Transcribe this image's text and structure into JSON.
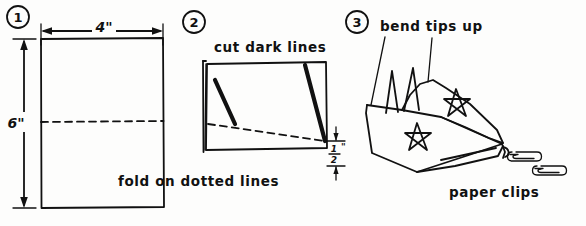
{
  "figure": {
    "ink_color": "#111111",
    "background_color": "#fdfdfc"
  },
  "steps": [
    {
      "number": "1",
      "badge": "1",
      "labels": {
        "width_dimension": "4\"",
        "height_dimension": "6\"",
        "caption": "fold on dotted lines"
      }
    },
    {
      "number": "2",
      "badge": "2",
      "labels": {
        "caption_top": "cut dark lines",
        "edge_dimension_whole": "",
        "edge_dimension_numerator": "1",
        "edge_dimension_denominator": "2",
        "edge_dimension_unit": "\"",
        "edge_dimension_text": "1/2\""
      }
    },
    {
      "number": "3",
      "badge": "3",
      "labels": {
        "caption_top": "bend tips up",
        "caption_bottom": "paper clips"
      }
    }
  ],
  "icons": {
    "circle_one": "circled-number-one",
    "circle_two": "circled-number-two",
    "circle_three": "circled-number-three",
    "arrow_left": "arrow-left-icon",
    "arrow_right": "arrow-right-icon",
    "arrow_up": "arrow-up-icon",
    "arrow_down": "arrow-down-icon",
    "star": "star-icon",
    "paper_clip": "paper-clip-icon"
  }
}
